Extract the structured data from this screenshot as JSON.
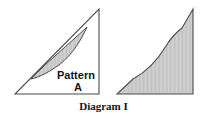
{
  "figure": {
    "caption": "Diagram I",
    "labels": {
      "pattern_word": "Pattern",
      "pattern_letter": "A"
    },
    "colors": {
      "background": "#ffffff",
      "outline": "#3a3a3a",
      "shade_fill": "#d2d2d2",
      "hatch_line": "#b9b9b9",
      "text": "#141414"
    },
    "left_shape": {
      "name": "right-triangle-with-pattern-a",
      "triangle_points": "15,94 99,94 99,9",
      "lens_region_description": "crescent between triangle hypotenuse and a concave curve",
      "lens_path": "M 31,79 C 48,61 70,44 87,27 C 80,40 72,55 58,66 C 48,73 40,77 31,79 Z"
    },
    "right_shape": {
      "name": "rearranged-pattern-shape",
      "path": "M 117,94 L 133,79 C 145,72 156,62 166,46 C 173,36 178,31 182,28 L 193,9 L 193,94 Z"
    }
  }
}
